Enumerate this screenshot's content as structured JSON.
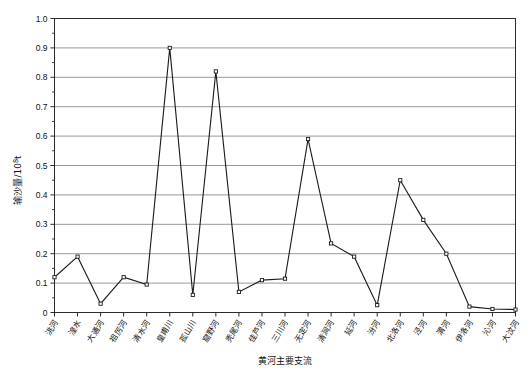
{
  "chart_data": {
    "type": "line",
    "title": "",
    "xlabel": "黄河主要支流",
    "ylabel": "输沙量/10⁸t",
    "ylabel_parts": {
      "main": "输沙量/10",
      "exponent": "8",
      "unit": "t"
    },
    "ylim": [
      0,
      1.0
    ],
    "ytick_values": [
      0,
      0.1,
      0.2,
      0.3,
      0.4,
      0.5,
      0.6,
      0.7,
      0.8,
      0.9,
      1.0
    ],
    "ytick_labels": [
      "0",
      "0.1",
      "0.2",
      "0.3",
      "0.4",
      "0.5",
      "0.6",
      "0.7",
      "0.8",
      "0.9",
      "1.0"
    ],
    "minor_ytick_values": [
      0.05,
      0.15,
      0.25,
      0.35,
      0.45,
      0.55,
      0.65,
      0.75,
      0.85,
      0.95
    ],
    "grid": true,
    "grid_axis": "y",
    "legend": "none",
    "marker": "open-square",
    "line_color": "#1a1a1a",
    "grid_color": "#8c8c8c",
    "categories": [
      "洮河",
      "湟水",
      "大通河",
      "祖厉河",
      "清水河",
      "皇甫川",
      "孤山川",
      "窟野河",
      "秃尾河",
      "佳芦河",
      "三川河",
      "无定河",
      "清涧河",
      "延河",
      "汾河",
      "北洛河",
      "泾河",
      "渭河",
      "伊洛河",
      "沁河",
      "大汶河"
    ],
    "values": [
      0.12,
      0.19,
      0.03,
      0.12,
      0.095,
      0.9,
      0.06,
      0.82,
      0.07,
      0.11,
      0.115,
      0.59,
      0.235,
      0.19,
      0.025,
      0.45,
      0.315,
      0.2,
      0.02,
      0.012,
      0.01
    ]
  }
}
